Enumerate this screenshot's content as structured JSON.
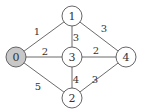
{
  "graph": {
    "nodes": [
      {
        "id": "0",
        "label": "0",
        "highlighted": true
      },
      {
        "id": "1",
        "label": "1",
        "highlighted": false
      },
      {
        "id": "2",
        "label": "2",
        "highlighted": false
      },
      {
        "id": "3",
        "label": "3",
        "highlighted": false
      },
      {
        "id": "4",
        "label": "4",
        "highlighted": false
      }
    ],
    "edges": [
      {
        "from": "0",
        "to": "1",
        "weight": "1"
      },
      {
        "from": "0",
        "to": "3",
        "weight": "2"
      },
      {
        "from": "0",
        "to": "2",
        "weight": "5"
      },
      {
        "from": "1",
        "to": "3",
        "weight": "3"
      },
      {
        "from": "1",
        "to": "4",
        "weight": "3"
      },
      {
        "from": "3",
        "to": "4",
        "weight": "2"
      },
      {
        "from": "3",
        "to": "2",
        "weight": "4"
      },
      {
        "from": "2",
        "to": "4",
        "weight": "3"
      }
    ],
    "colors": {
      "highlight_fill": "#c8c8c8",
      "node_fill": "#ffffff",
      "stroke": "#555555"
    }
  }
}
